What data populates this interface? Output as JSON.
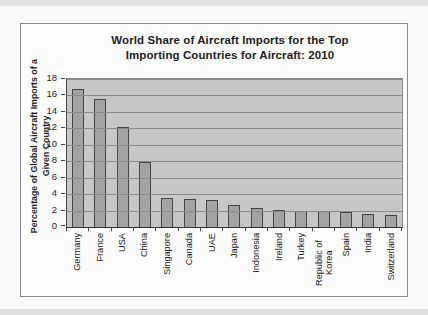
{
  "chart_data": {
    "type": "bar",
    "title": "World Share of Aircraft Imports for the Top\nImporting Countries for Aircraft: 2010",
    "ylabel": "Percentage of Global Aircraft Imports of a\nGiven Country",
    "xlabel": "",
    "categories": [
      "Germany",
      "France",
      "USA",
      "China",
      "Singapore",
      "Canada",
      "UAE",
      "Japan",
      "Indonesia",
      "Ireland",
      "Turkey",
      "Republic of Korea",
      "Spain",
      "India",
      "Switzerland"
    ],
    "values": [
      16.8,
      15.6,
      12.2,
      7.9,
      3.5,
      3.4,
      3.3,
      2.7,
      2.3,
      2.1,
      2.0,
      1.9,
      1.8,
      1.6,
      1.5
    ],
    "ylim": [
      0,
      18
    ],
    "ytick_step": 2,
    "yticks": [
      18,
      16,
      14,
      12,
      10,
      8,
      6,
      4,
      2,
      0
    ],
    "grid": true,
    "legend": "none",
    "colors": {
      "plot_background": "#c6c6c6",
      "bar_fill": "#a3a3a3",
      "bar_border": "#464646",
      "gridline": "#8c8c8c",
      "frame_border": "#8a8a8a",
      "text": "#1c1c1c"
    }
  }
}
